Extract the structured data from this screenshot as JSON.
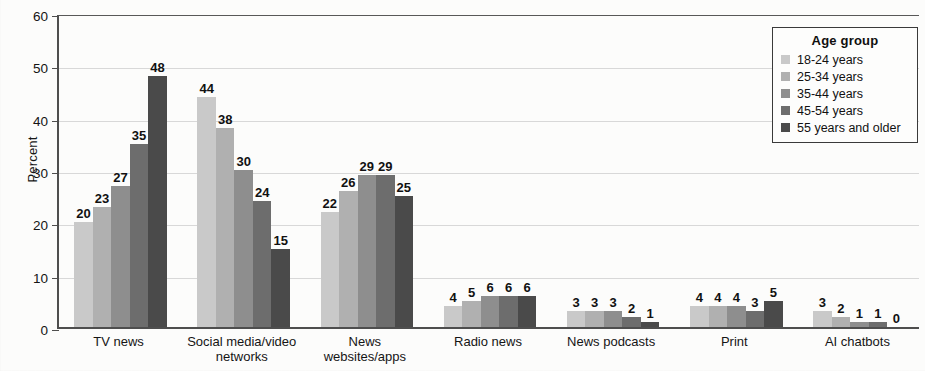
{
  "chart_data": {
    "type": "bar",
    "title": "",
    "subtitle": "",
    "xlabel": "",
    "ylabel": "Percent",
    "ylim": [
      0,
      60
    ],
    "yticks": [
      0,
      10,
      20,
      30,
      40,
      50,
      60
    ],
    "ytick_labels": [
      "0",
      "10",
      "20",
      "30",
      "40",
      "50",
      "60"
    ],
    "grid": true,
    "legend_position": "top-right",
    "legend_title": "Age group",
    "categories": [
      "TV news",
      "Social media/video networks",
      "News websites/apps",
      "Radio news",
      "News podcasts",
      "Print",
      "AI chatbots"
    ],
    "category_lines": [
      [
        "TV news"
      ],
      [
        "Social media/video",
        "networks"
      ],
      [
        "News",
        "websites/apps"
      ],
      [
        "Radio news"
      ],
      [
        "News podcasts"
      ],
      [
        "Print"
      ],
      [
        "AI chatbots"
      ]
    ],
    "series": [
      {
        "name": "18-24 years",
        "color": "#c9c9c9",
        "values": [
          20,
          44,
          22,
          4,
          3,
          4,
          3
        ]
      },
      {
        "name": "25-34 years",
        "color": "#b0b0b0",
        "values": [
          23,
          38,
          26,
          5,
          3,
          4,
          2
        ]
      },
      {
        "name": "35-44 years",
        "color": "#8e8e8e",
        "values": [
          27,
          30,
          29,
          6,
          3,
          4,
          1
        ]
      },
      {
        "name": "45-54 years",
        "color": "#6d6d6d",
        "values": [
          35,
          24,
          29,
          6,
          2,
          3,
          1
        ]
      },
      {
        "name": "55 years and older",
        "color": "#4a4a4a",
        "values": [
          48,
          15,
          25,
          6,
          1,
          5,
          0
        ]
      }
    ],
    "data_labels": [
      [
        "20",
        "23",
        "27",
        "35",
        "48"
      ],
      [
        "44",
        "38",
        "30",
        "24",
        "15"
      ],
      [
        "22",
        "26",
        "29",
        "29",
        "25"
      ],
      [
        "4",
        "5",
        "6",
        "6",
        "6"
      ],
      [
        "3",
        "3",
        "3",
        "2",
        "1"
      ],
      [
        "4",
        "4",
        "4",
        "3",
        "5"
      ],
      [
        "3",
        "2",
        "1",
        "1",
        "0"
      ]
    ]
  }
}
